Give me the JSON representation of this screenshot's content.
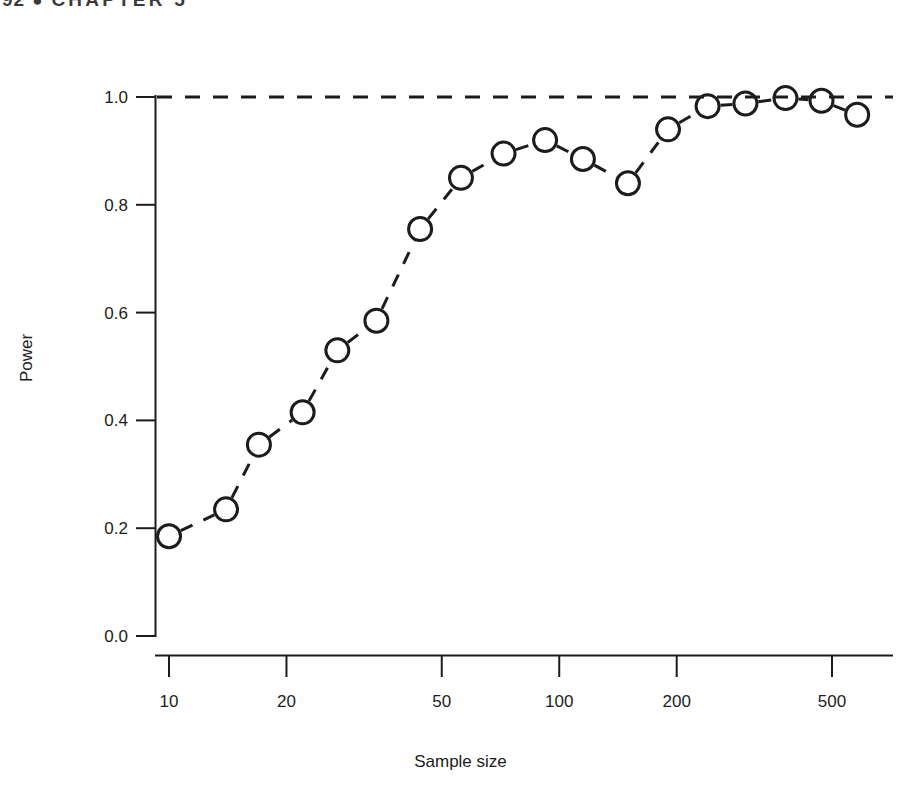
{
  "page": {
    "folio": "92",
    "bullet": "●",
    "running_head": "CHAPTER 5"
  },
  "chart_data": {
    "type": "line",
    "title": "",
    "subtitle": "",
    "xlabel": "Sample size",
    "ylabel": "Power",
    "xscale": "log",
    "yscale": "linear",
    "xlim": [
      9.0,
      640.0
    ],
    "ylim": [
      0.0,
      1.04
    ],
    "grid": false,
    "legend": null,
    "marker": "open-circle",
    "linestyle": "dashed",
    "color": "#1c1c1c",
    "xticks": [
      10,
      20,
      50,
      100,
      200,
      500
    ],
    "xticklabels": [
      "10",
      "20",
      "50",
      "100",
      "200",
      "500"
    ],
    "yticks": [
      0.0,
      0.2,
      0.4,
      0.6,
      0.8,
      1.0
    ],
    "yticklabels": [
      "0.0",
      "0.2",
      "0.4",
      "0.6",
      "0.8",
      "1.0"
    ],
    "reference_line": {
      "orientation": "horizontal",
      "y": 1.0,
      "style": "dashed"
    },
    "series": [
      {
        "name": "Power",
        "x": [
          10,
          14,
          17,
          22,
          27,
          34,
          44,
          56,
          72,
          92,
          115,
          150,
          190,
          240,
          300,
          380,
          470,
          580
        ],
        "values": [
          0.185,
          0.235,
          0.355,
          0.415,
          0.53,
          0.585,
          0.755,
          0.85,
          0.895,
          0.92,
          0.885,
          0.84,
          0.94,
          0.983,
          0.988,
          0.998,
          0.993,
          0.967
        ]
      }
    ]
  }
}
